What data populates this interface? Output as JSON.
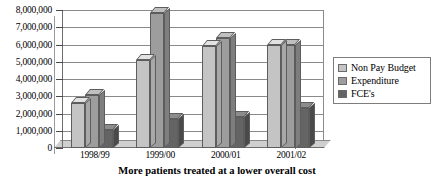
{
  "chart_data": {
    "type": "bar",
    "title": "",
    "caption": "More patients treated at a lower overall cost",
    "categories": [
      "1998/99",
      "1999/00",
      "2000/01",
      "2001/02"
    ],
    "series": [
      {
        "name": "Non Pay Budget",
        "color": "#c4c4c4",
        "values": [
          2600000,
          5100000,
          5900000,
          5950000
        ]
      },
      {
        "name": "Expenditure",
        "color": "#9d9d9d",
        "values": [
          3100000,
          7800000,
          6400000,
          6000000
        ]
      },
      {
        "name": "FCE's",
        "color": "#646464",
        "values": [
          1050000,
          1700000,
          1800000,
          2300000
        ]
      }
    ],
    "xlabel": "",
    "ylabel": "",
    "ylim": [
      0,
      8000000
    ],
    "ytick_labels": [
      "8,000,000",
      "7,000,000",
      "6,000,000",
      "5,000,000",
      "4,000,000",
      "3,000,000",
      "2,000,000",
      "1,000,000",
      "0"
    ],
    "ytick_values": [
      8000000,
      7000000,
      6000000,
      5000000,
      4000000,
      3000000,
      2000000,
      1000000,
      0
    ],
    "grid": true,
    "legend_position": "right",
    "style": "3d-clustered-column"
  }
}
